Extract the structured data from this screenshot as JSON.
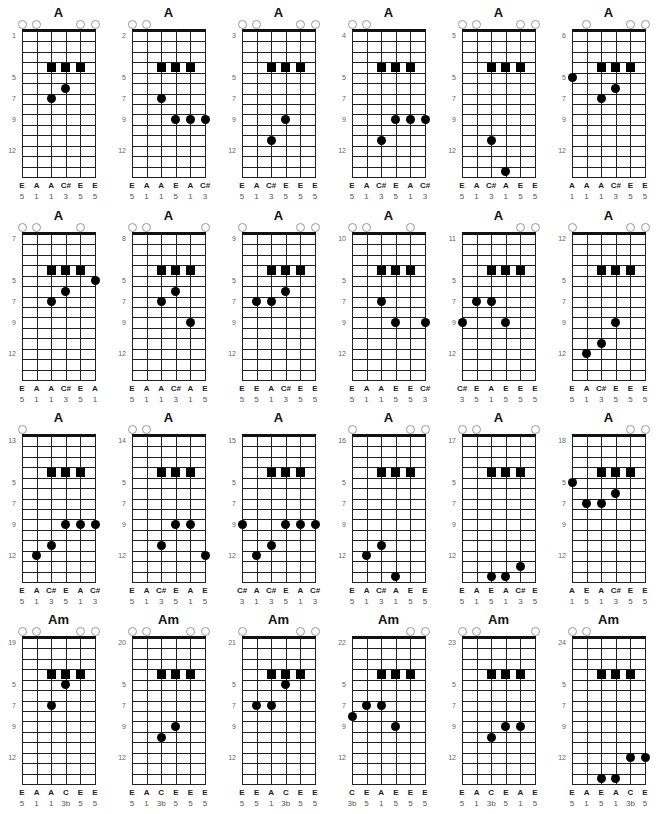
{
  "layout": {
    "col_x": [
      0,
      110,
      220,
      330,
      440,
      550
    ],
    "row_y": [
      0,
      203,
      405,
      607
    ]
  },
  "fret_marker_labels": {
    "rows": [
      1,
      5,
      7,
      9,
      12
    ],
    "values_after_first": [
      "5",
      "7",
      "9",
      "12"
    ]
  },
  "charts": [
    {
      "title": "A",
      "start": "1",
      "open": [
        0,
        1,
        4,
        5
      ],
      "squares": [
        [
          4,
          2
        ],
        [
          4,
          3
        ],
        [
          4,
          4
        ]
      ],
      "dots": [
        [
          7,
          2
        ],
        [
          6,
          3
        ]
      ],
      "notes": [
        "E",
        "A",
        "A",
        "C#",
        "E",
        "E"
      ],
      "intervals": [
        "5",
        "1",
        "1",
        "3",
        "5",
        "5"
      ]
    },
    {
      "title": "A",
      "start": "2",
      "open": [
        0,
        1
      ],
      "squares": [
        [
          4,
          2
        ],
        [
          4,
          3
        ],
        [
          4,
          4
        ]
      ],
      "dots": [
        [
          7,
          2
        ],
        [
          9,
          3
        ],
        [
          9,
          4
        ],
        [
          9,
          5
        ]
      ],
      "notes": [
        "E",
        "A",
        "A",
        "E",
        "A",
        "C#"
      ],
      "intervals": [
        "5",
        "1",
        "1",
        "5",
        "1",
        "3"
      ]
    },
    {
      "title": "A",
      "start": "3",
      "open": [
        0,
        1,
        4,
        5
      ],
      "squares": [
        [
          4,
          2
        ],
        [
          4,
          3
        ],
        [
          4,
          4
        ]
      ],
      "dots": [
        [
          11,
          2
        ],
        [
          9,
          3
        ]
      ],
      "notes": [
        "E",
        "A",
        "C#",
        "E",
        "E",
        "E"
      ],
      "intervals": [
        "5",
        "1",
        "3",
        "5",
        "5",
        "5"
      ]
    },
    {
      "title": "A",
      "start": "4",
      "open": [
        0,
        1
      ],
      "squares": [
        [
          4,
          2
        ],
        [
          4,
          3
        ],
        [
          4,
          4
        ]
      ],
      "dots": [
        [
          11,
          2
        ],
        [
          9,
          3
        ],
        [
          9,
          4
        ],
        [
          9,
          5
        ]
      ],
      "notes": [
        "E",
        "A",
        "C#",
        "E",
        "A",
        "C#"
      ],
      "intervals": [
        "5",
        "1",
        "3",
        "5",
        "1",
        "3"
      ]
    },
    {
      "title": "A",
      "start": "5",
      "open": [
        0,
        1,
        4,
        5
      ],
      "squares": [
        [
          4,
          2
        ],
        [
          4,
          3
        ],
        [
          4,
          4
        ]
      ],
      "dots": [
        [
          11,
          2
        ],
        [
          14,
          3
        ]
      ],
      "notes": [
        "E",
        "A",
        "C#",
        "A",
        "E",
        "E"
      ],
      "intervals": [
        "5",
        "1",
        "3",
        "1",
        "5",
        "5"
      ]
    },
    {
      "title": "A",
      "start": "6",
      "open": [
        1,
        4,
        5
      ],
      "squares": [
        [
          4,
          2
        ],
        [
          4,
          3
        ],
        [
          4,
          4
        ]
      ],
      "dots": [
        [
          5,
          0
        ],
        [
          7,
          2
        ],
        [
          6,
          3
        ]
      ],
      "notes": [
        "A",
        "A",
        "A",
        "C#",
        "E",
        "E"
      ],
      "intervals": [
        "1",
        "1",
        "1",
        "3",
        "5",
        "5"
      ]
    },
    {
      "title": "A",
      "start": "7",
      "open": [
        0,
        1,
        4
      ],
      "squares": [
        [
          4,
          2
        ],
        [
          4,
          3
        ],
        [
          4,
          4
        ]
      ],
      "dots": [
        [
          5,
          5
        ],
        [
          7,
          2
        ],
        [
          6,
          3
        ]
      ],
      "notes": [
        "E",
        "A",
        "A",
        "C#",
        "E",
        "A"
      ],
      "intervals": [
        "5",
        "1",
        "1",
        "3",
        "5",
        "1"
      ]
    },
    {
      "title": "A",
      "start": "8",
      "open": [
        0,
        1,
        5
      ],
      "squares": [
        [
          4,
          2
        ],
        [
          4,
          3
        ],
        [
          4,
          4
        ]
      ],
      "dots": [
        [
          7,
          2
        ],
        [
          6,
          3
        ],
        [
          9,
          4
        ]
      ],
      "notes": [
        "E",
        "A",
        "A",
        "C#",
        "A",
        "E"
      ],
      "intervals": [
        "5",
        "1",
        "1",
        "3",
        "1",
        "5"
      ]
    },
    {
      "title": "A",
      "start": "9",
      "open": [
        0,
        4,
        5
      ],
      "squares": [
        [
          4,
          2
        ],
        [
          4,
          3
        ],
        [
          4,
          4
        ]
      ],
      "dots": [
        [
          7,
          1
        ],
        [
          7,
          2
        ],
        [
          6,
          3
        ]
      ],
      "notes": [
        "E",
        "E",
        "A",
        "C#",
        "E",
        "E"
      ],
      "intervals": [
        "5",
        "5",
        "1",
        "3",
        "5",
        "5"
      ]
    },
    {
      "title": "A",
      "start": "10",
      "open": [
        0,
        1,
        4
      ],
      "squares": [
        [
          4,
          2
        ],
        [
          4,
          3
        ],
        [
          4,
          4
        ]
      ],
      "dots": [
        [
          7,
          2
        ],
        [
          9,
          3
        ],
        [
          9,
          5
        ]
      ],
      "notes": [
        "E",
        "A",
        "A",
        "E",
        "E",
        "C#"
      ],
      "intervals": [
        "5",
        "1",
        "1",
        "5",
        "5",
        "3"
      ]
    },
    {
      "title": "A",
      "start": "11",
      "open": [
        4,
        5
      ],
      "squares": [
        [
          4,
          2
        ],
        [
          4,
          3
        ],
        [
          4,
          4
        ]
      ],
      "dots": [
        [
          9,
          0
        ],
        [
          7,
          1
        ],
        [
          7,
          2
        ],
        [
          9,
          3
        ]
      ],
      "notes": [
        "C#",
        "E",
        "A",
        "E",
        "E",
        "E"
      ],
      "intervals": [
        "3",
        "5",
        "1",
        "5",
        "5",
        "5"
      ]
    },
    {
      "title": "A",
      "start": "12",
      "open": [
        0,
        4,
        5
      ],
      "squares": [
        [
          4,
          2
        ],
        [
          4,
          3
        ],
        [
          4,
          4
        ]
      ],
      "dots": [
        [
          12,
          1
        ],
        [
          11,
          2
        ],
        [
          9,
          3
        ]
      ],
      "notes": [
        "E",
        "A",
        "C#",
        "E",
        "E",
        "E"
      ],
      "intervals": [
        "5",
        "1",
        "3",
        "5",
        "5",
        "5"
      ]
    },
    {
      "title": "A",
      "start": "13",
      "open": [
        0
      ],
      "squares": [
        [
          4,
          2
        ],
        [
          4,
          3
        ],
        [
          4,
          4
        ]
      ],
      "dots": [
        [
          12,
          1
        ],
        [
          11,
          2
        ],
        [
          9,
          3
        ],
        [
          9,
          4
        ],
        [
          9,
          5
        ]
      ],
      "notes": [
        "E",
        "A",
        "C#",
        "E",
        "A",
        "C#"
      ],
      "intervals": [
        "5",
        "1",
        "3",
        "5",
        "1",
        "3"
      ]
    },
    {
      "title": "A",
      "start": "14",
      "open": [
        0,
        1
      ],
      "squares": [
        [
          4,
          2
        ],
        [
          4,
          3
        ],
        [
          4,
          4
        ]
      ],
      "dots": [
        [
          11,
          2
        ],
        [
          9,
          3
        ],
        [
          9,
          4
        ],
        [
          12,
          5
        ]
      ],
      "notes": [
        "E",
        "A",
        "C#",
        "E",
        "A",
        "E"
      ],
      "intervals": [
        "5",
        "1",
        "3",
        "5",
        "1",
        "5"
      ]
    },
    {
      "title": "A",
      "start": "15",
      "open": [],
      "squares": [
        [
          4,
          2
        ],
        [
          4,
          3
        ],
        [
          4,
          4
        ]
      ],
      "dots": [
        [
          9,
          0
        ],
        [
          12,
          1
        ],
        [
          11,
          2
        ],
        [
          9,
          3
        ],
        [
          9,
          4
        ],
        [
          9,
          5
        ]
      ],
      "notes": [
        "C#",
        "A",
        "C#",
        "E",
        "A",
        "C#"
      ],
      "intervals": [
        "3",
        "1",
        "3",
        "5",
        "1",
        "3"
      ]
    },
    {
      "title": "A",
      "start": "16",
      "open": [
        0,
        4,
        5
      ],
      "squares": [
        [
          4,
          2
        ],
        [
          4,
          3
        ],
        [
          4,
          4
        ]
      ],
      "dots": [
        [
          12,
          1
        ],
        [
          11,
          2
        ],
        [
          14,
          3
        ]
      ],
      "notes": [
        "E",
        "A",
        "C#",
        "A",
        "E",
        "E"
      ],
      "intervals": [
        "5",
        "1",
        "3",
        "1",
        "5",
        "5"
      ]
    },
    {
      "title": "A",
      "start": "17",
      "open": [
        0,
        1,
        5
      ],
      "squares": [
        [
          4,
          2
        ],
        [
          4,
          3
        ],
        [
          4,
          4
        ]
      ],
      "dots": [
        [
          14,
          2
        ],
        [
          14,
          3
        ],
        [
          13,
          4
        ]
      ],
      "notes": [
        "E",
        "A",
        "E",
        "A",
        "C#",
        "E"
      ],
      "intervals": [
        "5",
        "1",
        "5",
        "1",
        "3",
        "5"
      ]
    },
    {
      "title": "A",
      "start": "18",
      "open": [
        4,
        5
      ],
      "squares": [
        [
          4,
          2
        ],
        [
          4,
          3
        ],
        [
          4,
          4
        ]
      ],
      "dots": [
        [
          5,
          0
        ],
        [
          7,
          1
        ],
        [
          7,
          2
        ],
        [
          6,
          3
        ]
      ],
      "notes": [
        "A",
        "E",
        "A",
        "C#",
        "E",
        "E"
      ],
      "intervals": [
        "1",
        "5",
        "1",
        "3",
        "5",
        "5"
      ]
    },
    {
      "title": "Am",
      "start": "19",
      "open": [
        0,
        1,
        4,
        5
      ],
      "squares": [
        [
          4,
          2
        ],
        [
          4,
          3
        ],
        [
          4,
          4
        ]
      ],
      "dots": [
        [
          5,
          3
        ],
        [
          7,
          2
        ]
      ],
      "notes": [
        "E",
        "A",
        "A",
        "C",
        "E",
        "E"
      ],
      "intervals": [
        "5",
        "1",
        "1",
        "3b",
        "5",
        "5"
      ]
    },
    {
      "title": "Am",
      "start": "20",
      "open": [
        0,
        1,
        4,
        5
      ],
      "squares": [
        [
          4,
          2
        ],
        [
          4,
          3
        ],
        [
          4,
          4
        ]
      ],
      "dots": [
        [
          9,
          3
        ],
        [
          10,
          2
        ]
      ],
      "notes": [
        "E",
        "A",
        "C",
        "E",
        "E",
        "E"
      ],
      "intervals": [
        "5",
        "1",
        "3b",
        "5",
        "5",
        "5"
      ]
    },
    {
      "title": "Am",
      "start": "21",
      "open": [
        0,
        4,
        5
      ],
      "squares": [
        [
          4,
          2
        ],
        [
          4,
          3
        ],
        [
          4,
          4
        ]
      ],
      "dots": [
        [
          5,
          3
        ],
        [
          7,
          1
        ],
        [
          7,
          2
        ]
      ],
      "notes": [
        "E",
        "E",
        "A",
        "C",
        "E",
        "E"
      ],
      "intervals": [
        "5",
        "5",
        "1",
        "3b",
        "5",
        "5"
      ]
    },
    {
      "title": "Am",
      "start": "22",
      "open": [
        4,
        5
      ],
      "squares": [
        [
          4,
          2
        ],
        [
          4,
          3
        ],
        [
          4,
          4
        ]
      ],
      "dots": [
        [
          7,
          1
        ],
        [
          7,
          2
        ],
        [
          8,
          0
        ],
        [
          9,
          3
        ]
      ],
      "notes": [
        "C",
        "E",
        "A",
        "E",
        "E",
        "E"
      ],
      "intervals": [
        "3b",
        "5",
        "1",
        "5",
        "5",
        "5"
      ]
    },
    {
      "title": "Am",
      "start": "23",
      "open": [
        0,
        1,
        5
      ],
      "squares": [
        [
          4,
          2
        ],
        [
          4,
          3
        ],
        [
          4,
          4
        ]
      ],
      "dots": [
        [
          9,
          3
        ],
        [
          9,
          4
        ],
        [
          10,
          2
        ]
      ],
      "notes": [
        "E",
        "A",
        "C",
        "E",
        "A",
        "E"
      ],
      "intervals": [
        "5",
        "1",
        "3b",
        "5",
        "1",
        "5"
      ]
    },
    {
      "title": "Am",
      "start": "24",
      "open": [
        0,
        1
      ],
      "squares": [
        [
          4,
          2
        ],
        [
          4,
          3
        ],
        [
          4,
          4
        ]
      ],
      "dots": [
        [
          14,
          2
        ],
        [
          14,
          3
        ],
        [
          12,
          4
        ],
        [
          12,
          5
        ]
      ],
      "notes": [
        "E",
        "A",
        "E",
        "A",
        "C",
        "E"
      ],
      "intervals": [
        "5",
        "1",
        "5",
        "1",
        "3b",
        "5"
      ]
    }
  ]
}
